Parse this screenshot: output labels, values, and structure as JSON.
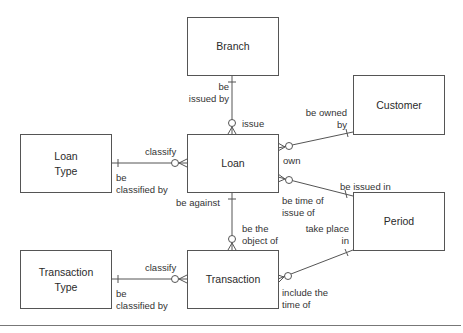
{
  "entities": {
    "branch": "Branch",
    "customer": "Customer",
    "loan_type": "Loan\nType",
    "loan": "Loan",
    "period": "Period",
    "transaction_type": "Transaction\nType",
    "transaction": "Transaction"
  },
  "relationships": [
    {
      "from": "Branch",
      "to": "Loan",
      "from_label": "be\nissued by",
      "to_label": "issue"
    },
    {
      "from": "Loan Type",
      "to": "Loan",
      "from_label": "be\nclassified by",
      "to_label": "classify"
    },
    {
      "from": "Customer",
      "to": "Loan",
      "from_label": "be owned\nby",
      "to_label": "own"
    },
    {
      "from": "Period",
      "to": "Loan",
      "from_label": "be issued in",
      "to_label": "be time of\nissue of"
    },
    {
      "from": "Loan",
      "to": "Transaction",
      "from_label": "be against",
      "to_label": "be the\nobject of"
    },
    {
      "from": "Transaction Type",
      "to": "Transaction",
      "from_label": "be\nclassified by",
      "to_label": "classify"
    },
    {
      "from": "Period",
      "to": "Transaction",
      "from_label": "take place\nin",
      "to_label": "include the\ntime of"
    }
  ],
  "labels": {
    "be_issued_by": "be\nissued by",
    "issue": "issue",
    "be_owned_by": "be owned\nby",
    "own": "own",
    "classify_loan": "classify",
    "be_classified_by_loan": "be\nclassified by",
    "be_issued_in": "be issued in",
    "be_time_of_issue_of": "be time of\nissue of",
    "be_against": "be against",
    "be_the_object_of": "be the\nobject of",
    "take_place_in": "take place\nin",
    "classify_txn": "classify",
    "be_classified_by_txn": "be\nclassified by",
    "include_the_time_of": "include the\ntime of"
  },
  "colors": {
    "line": "#555555",
    "text": "#2a2a2a"
  }
}
